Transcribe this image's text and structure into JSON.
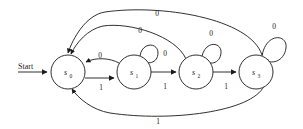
{
  "diagram": {
    "type": "finite-state-machine",
    "title": "",
    "start_label": "Start",
    "states": [
      {
        "id": "s0",
        "name": "s",
        "subscript": "0",
        "cx": 68,
        "cy": 72,
        "r": 17
      },
      {
        "id": "s1",
        "name": "s",
        "subscript": "1",
        "cx": 134,
        "cy": 72,
        "r": 17
      },
      {
        "id": "s2",
        "name": "s",
        "subscript": "2",
        "cx": 196,
        "cy": 72,
        "r": 17
      },
      {
        "id": "s3",
        "name": "s",
        "subscript": "3",
        "cx": 256,
        "cy": 72,
        "r": 17
      }
    ],
    "transitions": [
      {
        "from": "s0",
        "to": "s1",
        "label": "1",
        "kind": "straight",
        "label_x": 101,
        "label_y": 87
      },
      {
        "from": "s1",
        "to": "s0",
        "label": "0",
        "kind": "curve-up",
        "label_x": 100,
        "label_y": 59
      },
      {
        "from": "s1",
        "to": "s2",
        "label": "1",
        "kind": "straight",
        "label_x": 165,
        "label_y": 87
      },
      {
        "from": "s2",
        "to": "s3",
        "label": "1",
        "kind": "straight",
        "label_x": 226,
        "label_y": 87
      },
      {
        "from": "s1",
        "to": "s1",
        "label": "0",
        "kind": "self-loop",
        "label_x": 157,
        "label_y": 54
      },
      {
        "from": "s2",
        "to": "s2",
        "label": "0",
        "kind": "self-loop",
        "label_x": 207,
        "label_y": 30
      },
      {
        "from": "s3",
        "to": "s3",
        "label": "0",
        "kind": "self-loop",
        "label_x": 270,
        "label_y": 22
      },
      {
        "from": "s2",
        "to": "s0",
        "label": "0",
        "kind": "arc-top",
        "label_x": 142,
        "label_y": 32
      },
      {
        "from": "s3",
        "to": "s0",
        "label": "0",
        "kind": "arc-top",
        "label_x": 157,
        "label_y": 15
      },
      {
        "from": "s3",
        "to": "s0",
        "label": "1",
        "kind": "arc-bottom",
        "label_x": 158,
        "label_y": 122
      }
    ],
    "start_arrow": {
      "x1": 18,
      "y1": 72,
      "x2": 49,
      "y2": 72
    },
    "colors": {
      "stroke": "#1a1a1a",
      "background": "#ffffff",
      "text": "#1a1a1a"
    }
  }
}
